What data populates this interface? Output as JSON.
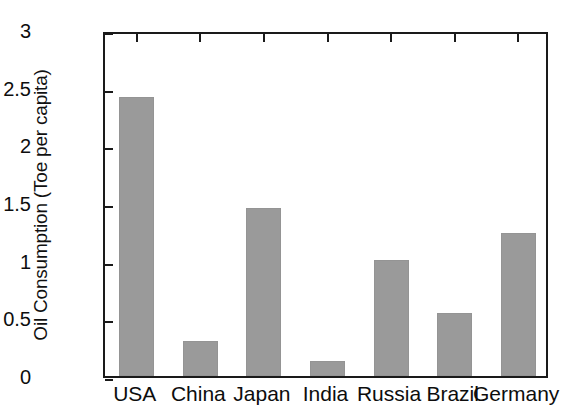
{
  "chart_data": {
    "type": "bar",
    "title": "",
    "subtitle": "",
    "xlabel": "",
    "ylabel": "Oil Consumption (Toe per capita)",
    "categories": [
      "USA",
      "China",
      "Japan",
      "India",
      "Russia",
      "Brazil",
      "Germany"
    ],
    "values": [
      2.42,
      0.3,
      1.46,
      0.13,
      1.01,
      0.55,
      1.24
    ],
    "series": [
      {
        "name": "Oil Consumption",
        "values": [
          2.42,
          0.3,
          1.46,
          0.13,
          1.01,
          0.55,
          1.24
        ]
      }
    ],
    "ylim": [
      0,
      3
    ],
    "yticks": [
      0,
      0.5,
      1,
      1.5,
      2,
      2.5,
      3
    ],
    "ytick_labels": [
      "0",
      "0.5",
      "1",
      "1.5",
      "2",
      "2.5",
      "3"
    ],
    "grid": false,
    "legend": false,
    "legend_position": "none",
    "bar_color": "#9a9a9a",
    "axis_color": "#1a1a1a",
    "background_color": "#ffffff",
    "annotations": []
  }
}
